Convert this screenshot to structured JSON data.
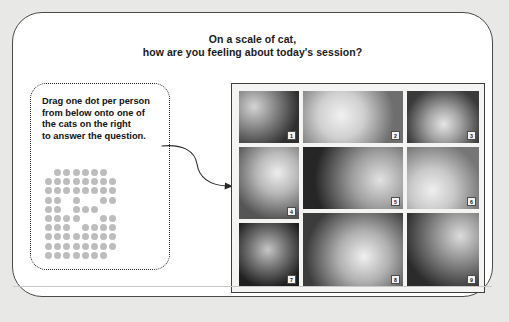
{
  "slide": {
    "background_color": "#e8e8e6",
    "frame_color": "#ffffff",
    "frame_border_color": "#4a4a4a"
  },
  "title": {
    "line1": "On a scale of cat,",
    "line2": "how are you feeling about today's session?"
  },
  "instruction": {
    "line1": "Drag one dot per person",
    "line2": "from below onto one of",
    "line3": "the cats on the right",
    "line4": "to answer the question.",
    "border_style": "dotted"
  },
  "dot_grid": {
    "dot_color": "#bdbdbd",
    "columns": 9,
    "rows": 10,
    "total_dots": 62,
    "pattern": [
      [
        0,
        1,
        1,
        1,
        1,
        1,
        1,
        0,
        0
      ],
      [
        1,
        1,
        1,
        1,
        1,
        1,
        1,
        1,
        0
      ],
      [
        1,
        1,
        1,
        1,
        1,
        1,
        1,
        1,
        0
      ],
      [
        1,
        1,
        0,
        1,
        0,
        0,
        1,
        1,
        0
      ],
      [
        1,
        1,
        0,
        1,
        1,
        1,
        0,
        0,
        0
      ],
      [
        1,
        1,
        1,
        1,
        0,
        0,
        1,
        1,
        0
      ],
      [
        1,
        1,
        1,
        0,
        1,
        1,
        1,
        1,
        0
      ],
      [
        1,
        1,
        1,
        1,
        1,
        1,
        1,
        1,
        0
      ],
      [
        1,
        1,
        1,
        1,
        1,
        1,
        1,
        1,
        0
      ],
      [
        1,
        1,
        1,
        1,
        1,
        1,
        1,
        0,
        0
      ]
    ]
  },
  "arrow": {
    "name": "curved-arrow",
    "color": "#2a2a2a",
    "direction": "left-to-right"
  },
  "photo_panel": {
    "border_color": "#3d3d3d",
    "background_color": "#f4f4f2",
    "photos": [
      {
        "number": "1",
        "alt": "tabby cat lying on dark floor",
        "tone_a": "#2f2f2f",
        "tone_b": "#8d8d8d",
        "tone_c": "#d4d4d4"
      },
      {
        "number": "2",
        "alt": "ginger cat sprawled sleepily",
        "tone_a": "#6e6e6e",
        "tone_b": "#cfcfcf",
        "tone_c": "#f1f1f1"
      },
      {
        "number": "3",
        "alt": "cat with paw over face",
        "tone_a": "#3a3a3a",
        "tone_b": "#a2a2a2",
        "tone_c": "#e6e6e6"
      },
      {
        "number": "4",
        "alt": "cat being held next to person",
        "tone_a": "#555555",
        "tone_b": "#b8b8b8",
        "tone_c": "#ededed"
      },
      {
        "number": "5",
        "alt": "black and white cat stepping out of bed",
        "tone_a": "#262626",
        "tone_b": "#9c9c9c",
        "tone_c": "#e2e2e2"
      },
      {
        "number": "6",
        "alt": "close up cat face looking at camera",
        "tone_a": "#767676",
        "tone_b": "#c9c9c9",
        "tone_c": "#efefef"
      },
      {
        "number": "7",
        "alt": "dark siamese cat portrait",
        "tone_a": "#1f1f1f",
        "tone_b": "#7a7a7a",
        "tone_c": "#c6c6c6"
      },
      {
        "number": "8",
        "alt": "tuxedo cat lying on back",
        "tone_a": "#3c3c3c",
        "tone_b": "#b0b0b0",
        "tone_c": "#f0f0f0"
      },
      {
        "number": "9",
        "alt": "cat on desk beside monitor",
        "tone_a": "#2b2b2b",
        "tone_b": "#8f8f8f",
        "tone_c": "#dcdcdc"
      }
    ]
  }
}
